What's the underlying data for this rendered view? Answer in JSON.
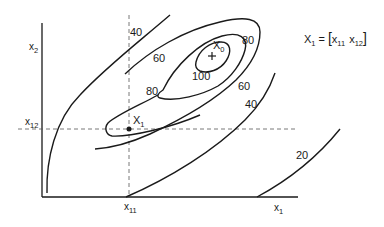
{
  "diagram": {
    "type": "contour-plot",
    "axes": {
      "x_label": {
        "main": "x",
        "sub": "1"
      },
      "y_label": {
        "main": "x",
        "sub": "2"
      }
    },
    "reference_ticks": {
      "x11": {
        "main": "x",
        "sub": "11"
      },
      "x12": {
        "main": "x",
        "sub": "12"
      }
    },
    "points": {
      "X1": {
        "main": "X",
        "sub": "1",
        "marker": "dot"
      },
      "X0": {
        "main": "X",
        "sub": "0",
        "marker": "cross"
      }
    },
    "contour_levels": [
      20,
      40,
      60,
      80,
      100
    ],
    "contour_labels": {
      "left_40": "40",
      "left_60": "60",
      "left_80": "80",
      "top_80": "80",
      "center_100": "100",
      "right_60": "60",
      "right_40": "40",
      "bottom_20": "20"
    },
    "formula": {
      "lhs_main": "X",
      "lhs_sub": "1",
      "equals": "=",
      "open_bracket": "[",
      "term1_main": "x",
      "term1_sub": "11",
      "term2_main": "x",
      "term2_sub": "12",
      "close_bracket": "]"
    }
  }
}
